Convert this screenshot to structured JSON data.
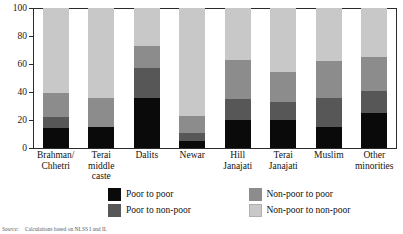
{
  "chart_data": {
    "type": "bar",
    "subtype": "stacked-bar-100",
    "title": "",
    "xlabel": "",
    "ylabel": "",
    "ylim": [
      0,
      100
    ],
    "yticks": [
      0,
      20,
      40,
      60,
      80,
      100
    ],
    "grid": false,
    "legend_position": "bottom",
    "categories": [
      "Brahman/ Chhetri",
      "Terai middle caste",
      "Dalits",
      "Newar",
      "Hill Janajati",
      "Terai Janajati",
      "Muslim",
      "Other minorities"
    ],
    "category_lines": [
      [
        "Brahman/",
        "Chhetri"
      ],
      [
        "Terai",
        "middle caste"
      ],
      [
        "Dalits",
        ""
      ],
      [
        "Newar",
        ""
      ],
      [
        "Hill",
        "Janajati"
      ],
      [
        "Terai",
        "Janajati"
      ],
      [
        "Muslim",
        ""
      ],
      [
        "Other",
        "minorities"
      ]
    ],
    "series": [
      {
        "name": "Poor to poor",
        "key": "pp",
        "color": "#0a0a0a",
        "values": [
          14,
          15,
          36,
          5,
          20,
          20,
          15,
          25
        ]
      },
      {
        "name": "Poor to non-poor",
        "key": "pn",
        "color": "#575757",
        "values": [
          8,
          0,
          21,
          6,
          15,
          13,
          21,
          16
        ]
      },
      {
        "name": "Non-poor to poor",
        "key": "np",
        "color": "#8c8c8c",
        "values": [
          17,
          21,
          16,
          12,
          28,
          21,
          26,
          24
        ]
      },
      {
        "name": "Non-poor to non-poor",
        "key": "nn",
        "color": "#c8c8c8",
        "values": [
          61,
          64,
          27,
          77,
          37,
          46,
          38,
          35
        ]
      }
    ]
  },
  "legend": {
    "items": [
      {
        "label": "Poor to poor",
        "key": "pp"
      },
      {
        "label": "Non-poor to poor",
        "key": "np"
      },
      {
        "label": "Poor to non-poor",
        "key": "pn"
      },
      {
        "label": "Non-poor to non-poor",
        "key": "nn"
      }
    ]
  },
  "footnote": {
    "label": "Source:",
    "text": "Calculations based on NLSS I and II."
  }
}
